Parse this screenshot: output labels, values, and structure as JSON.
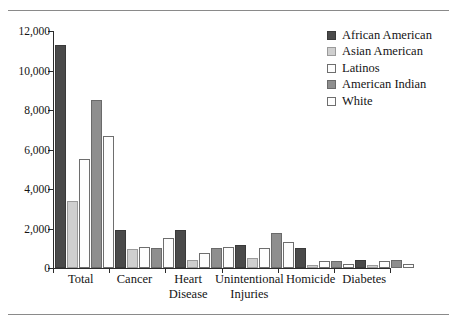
{
  "figure": {
    "clipped_title": "",
    "rules": {
      "top": true,
      "bottom": true
    }
  },
  "chart_data": {
    "type": "bar",
    "title": "",
    "xlabel": "",
    "ylabel": "",
    "ylim": [
      0,
      12000
    ],
    "yticks": [
      0,
      2000,
      4000,
      6000,
      8000,
      10000,
      12000
    ],
    "ytick_labels": [
      "0",
      "2,000",
      "4,000",
      "6,000",
      "8,000",
      "10,000",
      "12,000"
    ],
    "grid": false,
    "legend_position": "top-right",
    "categories": [
      "Total",
      "Cancer",
      "Heart Disease",
      "Unintentional Injuries",
      "Homicide",
      "Diabetes"
    ],
    "category_label_lines": [
      [
        "Total"
      ],
      [
        "Cancer"
      ],
      [
        "Heart",
        "Disease"
      ],
      [
        "Unintentional",
        "Injuries"
      ],
      [
        "Homicide"
      ],
      [
        "Diabetes"
      ]
    ],
    "series": [
      {
        "name": "African American",
        "color": "#4a4a4a",
        "values": [
          11300,
          1950,
          1950,
          1150,
          1000,
          420
        ]
      },
      {
        "name": "Asian American",
        "color": "#cfcfcf",
        "values": [
          3400,
          950,
          400,
          500,
          140,
          130
        ]
      },
      {
        "name": "Latinos",
        "color": "#fdfdfd",
        "values": [
          5500,
          1050,
          750,
          1000,
          330,
          330
        ]
      },
      {
        "name": "American Indian",
        "color": "#8e8e8e",
        "values": [
          8500,
          1000,
          1000,
          1750,
          350,
          420
        ]
      },
      {
        "name": "White",
        "color": "#fdfdfd",
        "values": [
          6700,
          1500,
          1050,
          1300,
          180,
          190
        ]
      }
    ]
  },
  "legend": {
    "items": [
      {
        "label": "African American",
        "swatch": "#4a4a4a",
        "border": "#3a3a3a"
      },
      {
        "label": "Asian American",
        "swatch": "#cfcfcf",
        "border": "#9a9a9a"
      },
      {
        "label": "Latinos",
        "swatch": "#fdfdfd",
        "border": "#6e6e6e"
      },
      {
        "label": "American Indian",
        "swatch": "#8e8e8e",
        "border": "#6a6a6a"
      },
      {
        "label": "White",
        "swatch": "#fdfdfd",
        "border": "#6e6e6e"
      }
    ]
  }
}
